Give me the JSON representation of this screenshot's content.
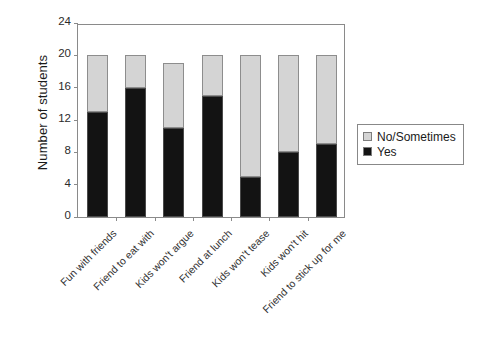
{
  "chart_data": {
    "type": "bar",
    "subtype": "stacked-vertical",
    "title": "",
    "xlabel": "",
    "ylabel": "Number of students",
    "ylim": [
      0,
      24
    ],
    "yticks": [
      0,
      4,
      8,
      12,
      16,
      20,
      24
    ],
    "grid": false,
    "legend_position": "right",
    "categories": [
      "Fun with friends",
      "Friend to eat with",
      "Kids won't argue",
      "Friend at lunch",
      "Kids won't tease",
      "Kids won't hit",
      "Friend to stick up for me"
    ],
    "series": [
      {
        "name": "Yes",
        "color": "#131313",
        "values": [
          13,
          16,
          11,
          15,
          5,
          8,
          9
        ]
      },
      {
        "name": "No/Sometimes",
        "color": "#d4d4d4",
        "values": [
          7,
          4,
          8,
          5,
          15,
          12,
          11
        ]
      }
    ],
    "totals": [
      20,
      20,
      19,
      20,
      20,
      20,
      20
    ]
  },
  "legend": {
    "entries": [
      {
        "label": "No/Sometimes",
        "color": "#d4d4d4"
      },
      {
        "label": "Yes",
        "color": "#131313"
      }
    ]
  }
}
